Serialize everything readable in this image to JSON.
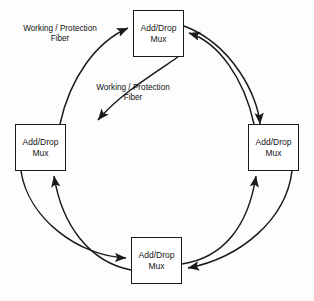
{
  "diagram": {
    "type": "ring-network",
    "background_color": "#fdfdfd",
    "stroke_color": "#1a1a1a",
    "nodes": [
      {
        "id": "top",
        "line1": "Add/Drop",
        "line2": "Mux"
      },
      {
        "id": "left",
        "line1": "Add/Drop",
        "line2": "Mux"
      },
      {
        "id": "right",
        "line1": "Add/Drop",
        "line2": "Mux"
      },
      {
        "id": "bottom",
        "line1": "Add/Drop",
        "line2": "Mux"
      }
    ],
    "labels": [
      {
        "id": "upper-left",
        "line1": "Working / Protection",
        "line2": "Fiber"
      },
      {
        "id": "center",
        "line1": "Working / Protection",
        "line2": "Fiber"
      }
    ]
  }
}
